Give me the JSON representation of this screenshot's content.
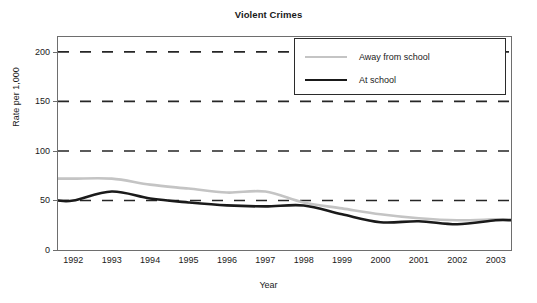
{
  "chart_data": {
    "type": "line",
    "title": "Violent Crimes",
    "xlabel": "Year",
    "ylabel": "Rate per 1,000",
    "xlim": [
      1991.6,
      2003.4
    ],
    "ylim": [
      0,
      215
    ],
    "ytick_values": [
      0,
      50,
      100,
      150,
      200
    ],
    "ytick_labels": [
      "0",
      "50",
      "100",
      "150",
      "200"
    ],
    "xtick_values": [
      1992,
      1993,
      1994,
      1995,
      1996,
      1997,
      1998,
      1999,
      2000,
      2001,
      2002,
      2003
    ],
    "xtick_labels": [
      "1992",
      "1993",
      "1994",
      "1995",
      "1996",
      "1997",
      "1998",
      "1999",
      "2000",
      "2001",
      "2002",
      "2003"
    ],
    "grid": "horizontal-dashed",
    "gridline_values": [
      50,
      100,
      150,
      200
    ],
    "legend_position": "top-right",
    "x": [
      1992,
      1993,
      1994,
      1995,
      1996,
      1997,
      1998,
      1999,
      2000,
      2001,
      2002,
      2003
    ],
    "series": [
      {
        "name": "Away from school",
        "color": "#c4c4c4",
        "linewidth": 2.6,
        "values": [
          72,
          72,
          66,
          62,
          58,
          59,
          48,
          42,
          36,
          32,
          30,
          31
        ]
      },
      {
        "name": "At school",
        "color": "#1a1a1a",
        "linewidth": 2.6,
        "values": [
          50,
          59,
          52,
          48,
          45,
          44,
          45,
          36,
          28,
          29,
          26,
          30
        ]
      }
    ]
  },
  "figure": {
    "title": "Violent Crimes",
    "xlabel": "Year",
    "ylabel": "Rate per 1,000",
    "background": "#ffffff",
    "frame_color": "#6e6e6e"
  },
  "legend": {
    "entries": [
      {
        "label": "Away from school",
        "color": "#c4c4c4"
      },
      {
        "label": "At school",
        "color": "#1a1a1a"
      }
    ]
  }
}
